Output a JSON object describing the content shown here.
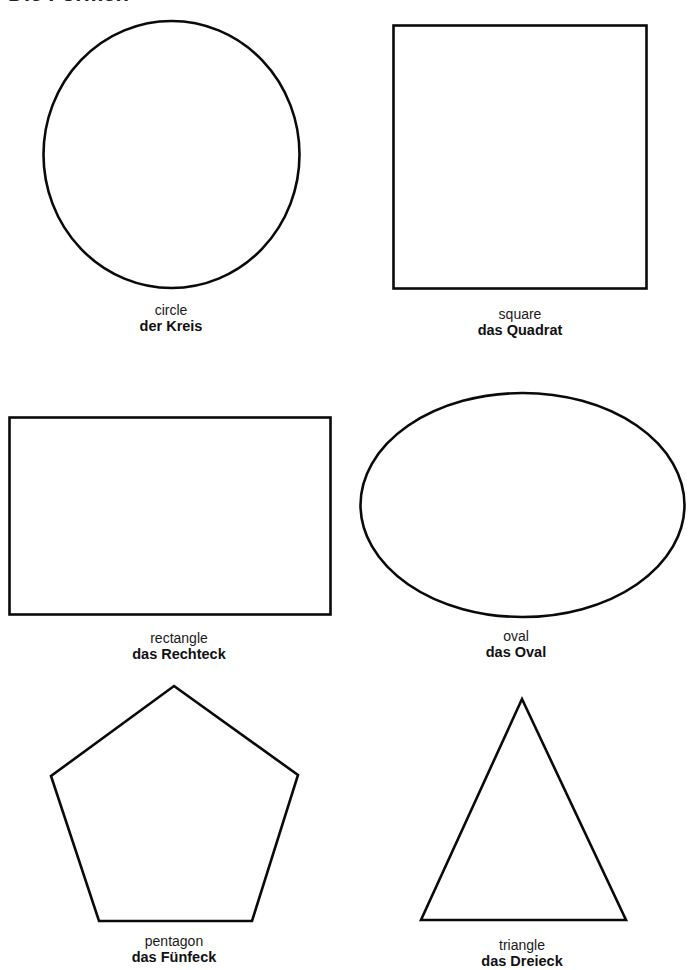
{
  "page": {
    "title": "Die Formen"
  },
  "shapes": [
    {
      "id": "circle",
      "english": "circle",
      "german": "der Kreis"
    },
    {
      "id": "square",
      "english": "square",
      "german": "das Quadrat"
    },
    {
      "id": "rectangle",
      "english": "rectangle",
      "german": "das Rechteck"
    },
    {
      "id": "oval",
      "english": "oval",
      "german": "das Oval"
    },
    {
      "id": "pentagon",
      "english": "pentagon",
      "german": "das Fünfeck"
    },
    {
      "id": "triangle",
      "english": "triangle",
      "german": "das Dreieck"
    }
  ],
  "colors": {
    "stroke": "#0a0a0a",
    "background": "#ffffff"
  }
}
